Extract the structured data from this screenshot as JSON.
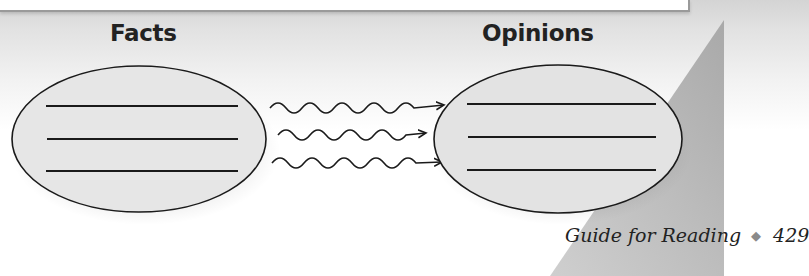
{
  "diagram": {
    "left_label": "Facts",
    "right_label": "Opinions",
    "left_lines": 3,
    "right_lines": 3,
    "connectors": 3,
    "connector_style": "wavy-arrow",
    "colors": {
      "ellipse_fill": "#e6e6e6",
      "stroke": "#1a1a1a",
      "page_corner": "#b8b8b8",
      "diamond": "#8a8a8a"
    }
  },
  "footer": {
    "section": "Guide for Reading",
    "separator": "◆",
    "page_number": "429"
  }
}
